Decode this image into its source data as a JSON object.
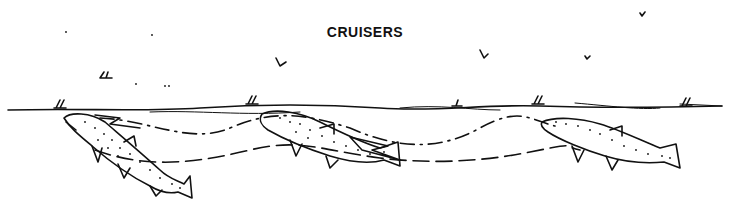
{
  "illustration": {
    "title": "CRUISERS",
    "ink_color": "#111111",
    "background": "#ffffff",
    "elements": {
      "water_surface": "water-surface-line",
      "fish": [
        {
          "name": "trout-left",
          "pose": "rising to surface, head up"
        },
        {
          "name": "trout-middle",
          "pose": "cruising, angled up"
        },
        {
          "name": "trout-right",
          "pose": "cruising, nearly level"
        }
      ],
      "paths": [
        "dashed-cruise-path-upper",
        "dashed-cruise-path-lower"
      ],
      "direction_arrows": [
        "arrow-left",
        "arrow-middle"
      ],
      "insects": [
        "mayfly-on-surface",
        "mayfly-in-air"
      ]
    }
  }
}
